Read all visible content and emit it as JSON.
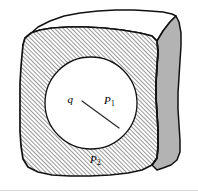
{
  "figure": {
    "colors": {
      "outline": "#111111",
      "hatch_line": "#555555",
      "hatch_background": "#ffffff",
      "right_face_fill": "#b3b3b3",
      "top_face_fill": "#ffffff",
      "cavity_fill": "#ffffff",
      "point_marker": "#000000",
      "radius_line": "#2b2b2b",
      "page_background": "#ffffff",
      "bottom_rule": "#d8d8d8"
    },
    "geometry": {
      "cavity_center_x": 91,
      "cavity_center_y": 103,
      "cavity_radius": 46,
      "charge_point_x": 82,
      "charge_point_y": 101,
      "inner_point_x": 100,
      "inner_point_y": 114,
      "radius_end_x": 119,
      "radius_end_y": 128,
      "outer_point_x": 85,
      "outer_point_y": 160
    },
    "labels": [
      {
        "id": "charge-label",
        "symbol": "q",
        "subscript": "",
        "x": 73,
        "y": 100,
        "anchor": "end"
      },
      {
        "id": "point-p1-label",
        "symbol": "P",
        "subscript": "1",
        "x": 104,
        "y": 101,
        "anchor": "start"
      },
      {
        "id": "point-p2-label",
        "symbol": "P",
        "subscript": "2",
        "x": 90,
        "y": 160,
        "anchor": "start"
      }
    ],
    "markers": [
      {
        "id": "charge-marker",
        "name": "charge-q-point",
        "cx": 82,
        "cy": 101,
        "r": 2.1
      },
      {
        "id": "p1-marker",
        "name": "point-p1-marker",
        "cx": 100,
        "cy": 114,
        "r": 2.1
      },
      {
        "id": "p2-marker",
        "name": "point-p2-marker",
        "cx": 85,
        "cy": 160,
        "r": 2.3
      }
    ],
    "paths": {
      "front_face": "M 23 45 L 25 38 L 31 33 L 40 30 L 52 28 L 68 27 L 86 27 L 104 28 L 122 30 L 140 33 L 152 36 L 157 41 L 158 52 L 157 66 L 156 82 L 156 98 L 157 114 L 158 130 L 158 146 L 157 158 L 152 165 L 142 170 L 128 173 L 110 175 L 90 176 L 70 176 L 52 175 L 38 172 L 28 167 L 23 159 L 21 146 L 20 131 L 20 115 L 20 99 L 20 83 L 21 67 L 22 55 Z",
      "top_face": "M 23 45 L 25 38 L 31 33 L 40 30 L 52 28 L 68 27 L 86 27 L 104 28 L 122 30 L 140 33 L 152 36 L 157 41 L 163 31 L 170 22 L 176 16 L 172 14 L 163 12 L 150 11 L 134 10 L 116 10 L 98 11 L 80 13 L 64 16 L 50 21 L 38 27 L 29 35 Z",
      "right_face": "M 157 41 L 163 31 L 170 22 L 176 16 L 179 22 L 181 33 L 181 46 L 180 61 L 179 77 L 178 93 L 178 109 L 179 125 L 180 140 L 180 152 L 177 160 L 171 165 L 163 168 L 157 170 L 152 165 L 157 158 L 158 146 L 158 130 L 157 114 L 156 98 L 156 82 L 157 66 L 158 52 Z",
      "right_face_inner_edge": "M 157 41 L 158 52 L 157 66 L 156 82 L 156 98 L 157 114 L 158 130 L 158 146 L 157 158 L 152 165"
    }
  }
}
